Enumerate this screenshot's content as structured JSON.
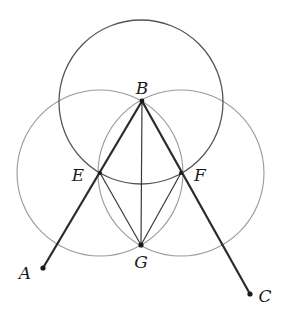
{
  "diagram": {
    "type": "geometric-construction",
    "points": {
      "A": {
        "label": "A",
        "x": 43,
        "y": 268,
        "label_x": 25,
        "label_y": 279
      },
      "B": {
        "label": "B",
        "x": 142,
        "y": 101,
        "label_x": 142,
        "label_y": 94
      },
      "C": {
        "label": "C",
        "x": 250,
        "y": 294,
        "label_x": 265,
        "label_y": 302
      },
      "E": {
        "label": "E",
        "x": 100,
        "y": 173,
        "label_x": 78,
        "label_y": 181
      },
      "F": {
        "label": "F",
        "x": 181,
        "y": 173,
        "label_x": 200,
        "label_y": 181
      },
      "G": {
        "label": "G",
        "x": 141,
        "y": 245,
        "label_x": 141,
        "label_y": 268
      }
    },
    "circles": [
      {
        "name": "circle-center-B",
        "cx": 141,
        "cy": 102,
        "r": 82,
        "color": "#555555"
      },
      {
        "name": "circle-center-E",
        "cx": 100,
        "cy": 173,
        "r": 83,
        "color": "#9a9a9a"
      },
      {
        "name": "circle-center-F",
        "cx": 181,
        "cy": 173,
        "r": 83,
        "color": "#9a9a9a"
      }
    ],
    "segments": [
      {
        "name": "ray-BA",
        "from": "B",
        "to": "A",
        "weight": "thick"
      },
      {
        "name": "ray-BC",
        "from": "B",
        "to": "C",
        "weight": "thick"
      },
      {
        "name": "segment-BG",
        "from": "B",
        "to": "G",
        "weight": "thin"
      },
      {
        "name": "segment-EG",
        "from": "E",
        "to": "G",
        "weight": "thin"
      },
      {
        "name": "segment-FG",
        "from": "F",
        "to": "G",
        "weight": "thin"
      }
    ],
    "colors": {
      "thick_line": "#2a2a2a",
      "thin_line": "#3a3a3a",
      "background": "#ffffff"
    }
  }
}
